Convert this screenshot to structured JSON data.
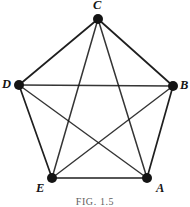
{
  "figure": {
    "caption": "FIG. 1.5",
    "background_color": "#ffffff",
    "ink_color": "#141414",
    "width": 190,
    "height": 207
  },
  "graph": {
    "type": "complete-graph",
    "vertex_count": 5,
    "edge_count": 10,
    "vertex_radius": 5,
    "vertices": [
      {
        "id": "C",
        "label": "C",
        "x": 98,
        "y": 19,
        "label_position": "above"
      },
      {
        "id": "B",
        "label": "B",
        "x": 173,
        "y": 86,
        "label_position": "right"
      },
      {
        "id": "A",
        "label": "A",
        "x": 147,
        "y": 178,
        "label_position": "below-right"
      },
      {
        "id": "E",
        "label": "E",
        "x": 52,
        "y": 178,
        "label_position": "below-left"
      },
      {
        "id": "D",
        "label": "D",
        "x": 19,
        "y": 85,
        "label_position": "left"
      }
    ],
    "edges": [
      {
        "from": "C",
        "to": "B",
        "kind": "perimeter",
        "width": 1.7
      },
      {
        "from": "B",
        "to": "A",
        "kind": "perimeter",
        "width": 1.7
      },
      {
        "from": "A",
        "to": "E",
        "kind": "perimeter",
        "width": 1.5
      },
      {
        "from": "E",
        "to": "D",
        "kind": "perimeter",
        "width": 1.7
      },
      {
        "from": "D",
        "to": "C",
        "kind": "perimeter",
        "width": 1.7
      },
      {
        "from": "C",
        "to": "E",
        "kind": "diagonal",
        "width": 1.5
      },
      {
        "from": "C",
        "to": "A",
        "kind": "diagonal",
        "width": 1.5
      },
      {
        "from": "D",
        "to": "B",
        "kind": "diagonal",
        "width": 1.4
      },
      {
        "from": "D",
        "to": "A",
        "kind": "diagonal",
        "width": 1.4
      },
      {
        "from": "E",
        "to": "B",
        "kind": "diagonal",
        "width": 1.4
      }
    ]
  }
}
